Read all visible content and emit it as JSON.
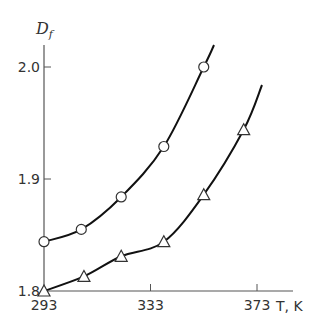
{
  "chart_data": {
    "type": "line",
    "title": "",
    "xlabel": "T, K",
    "ylabel": "D_f",
    "ylabel_main": "D",
    "ylabel_sub": "f",
    "xlim": [
      293,
      390
    ],
    "ylim": [
      1.8,
      2.02
    ],
    "xticks": [
      293,
      333,
      373
    ],
    "xtick_labels": [
      "293",
      "333",
      "373"
    ],
    "yticks": [
      1.8,
      1.9,
      2.0
    ],
    "ytick_labels": [
      "1.8",
      "1.9",
      "2.0"
    ],
    "grid": false,
    "legend": "none",
    "series": [
      {
        "name": "circles",
        "marker": "circle",
        "x": [
          293,
          307,
          322,
          338,
          353
        ],
        "values": [
          1.844,
          1.855,
          1.884,
          1.929,
          2.0
        ]
      },
      {
        "name": "triangles",
        "marker": "triangle",
        "x": [
          293,
          308,
          322,
          338,
          353,
          368
        ],
        "values": [
          1.8,
          1.813,
          1.831,
          1.844,
          1.886,
          1.944
        ]
      }
    ]
  }
}
